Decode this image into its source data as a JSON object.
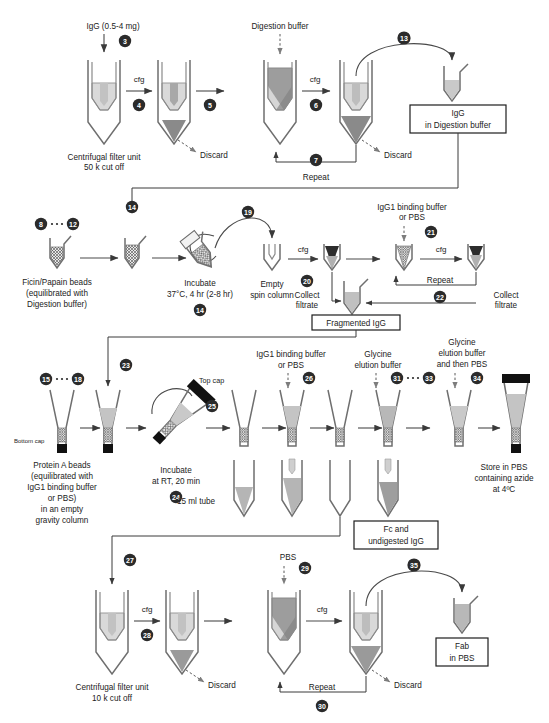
{
  "diagram": {
    "colors": {
      "light_fill": "#d9d9d9",
      "mid_fill": "#b4b4b4",
      "dark_fill": "#8f8f8f",
      "darker_fill": "#7a7a7a",
      "cap_black": "#111111",
      "line": "#3a3a3a",
      "outline": "#6f6f6f"
    }
  },
  "row1": {
    "input_label": "IgG (0.5-4 mg)",
    "reagent_label": "Digestion buffer",
    "unit_label_line1": "Centrifugal filter unit",
    "unit_label_line2": "50 k cut off",
    "cfg1": "cfg",
    "cfg2": "cfg",
    "discard1": "Discard",
    "discard2": "Discard",
    "repeat": "Repeat",
    "product_line1": "IgG",
    "product_line2": "in Digestion buffer",
    "steps": {
      "s3": "3",
      "s4": "4",
      "s5": "5",
      "s6": "6",
      "s7": "7",
      "s13": "13"
    }
  },
  "row2": {
    "beads_line1": "Ficin/Papain beads",
    "beads_line2": "(equilibrated with",
    "beads_line3": "Digestion buffer)",
    "incubate_line1": "Incubate",
    "incubate_line2": "37°C, 4 hr (2-8 hr)",
    "spin_line1": "Empty",
    "spin_line2": "spin column",
    "cfg1": "cfg",
    "cfg2": "cfg",
    "reagent_line1": "IgG1 binding buffer",
    "reagent_line2": "or PBS",
    "collect1_line1": "Collect",
    "collect1_line2": "filtrate",
    "collect2_line1": "Collect",
    "collect2_line2": "filtrate",
    "repeat": "Repeat",
    "product": "Fragmented IgG",
    "steps": {
      "s8": "8",
      "s12": "12",
      "s14a": "14",
      "s14b": "14",
      "s19": "19",
      "s20": "20",
      "s21": "21",
      "s22": "22"
    }
  },
  "row3": {
    "beads_line1": "Protein A beads",
    "beads_line2": "(equilibrated with",
    "beads_line3": "IgG1 binding buffer",
    "beads_line4": "or PBS)",
    "beads_line5": "in an empty",
    "beads_line6": "gravity column",
    "bottom_cap": "Bottom cap",
    "top_cap": "Top cap",
    "incubate_line1": "Incubate",
    "incubate_line2": "at RT, 20 min",
    "tube_label": "15 ml tube",
    "reagent1_line1": "IgG1 binding buffer",
    "reagent1_line2": "or PBS",
    "reagent2_line1": "Glycine",
    "reagent2_line2": "elution buffer",
    "reagent3_line1": "Glycine",
    "reagent3_line2": "elution buffer",
    "reagent3_line3": "and then PBS",
    "store_line1": "Store in PBS",
    "store_line2": "containing azide",
    "store_line3": "at 4ºC",
    "product_line1": "Fc and",
    "product_line2": "undigested IgG",
    "steps": {
      "s15": "15",
      "s18": "18",
      "s23": "23",
      "s24": "24",
      "s25": "25",
      "s26": "26",
      "s31": "31",
      "s33": "33",
      "s34": "34"
    }
  },
  "row4": {
    "unit_label_line1": "Centrifugal filter unit",
    "unit_label_line2": "10 k cut off",
    "cfg1": "cfg",
    "cfg2": "cfg",
    "reagent_label": "PBS",
    "discard1": "Discard",
    "discard2": "Discard",
    "repeat": "Repeat",
    "product_line1": "Fab",
    "product_line2": "in PBS",
    "steps": {
      "s27": "27",
      "s28": "28",
      "s29": "29",
      "s30": "30",
      "s35": "35"
    }
  }
}
